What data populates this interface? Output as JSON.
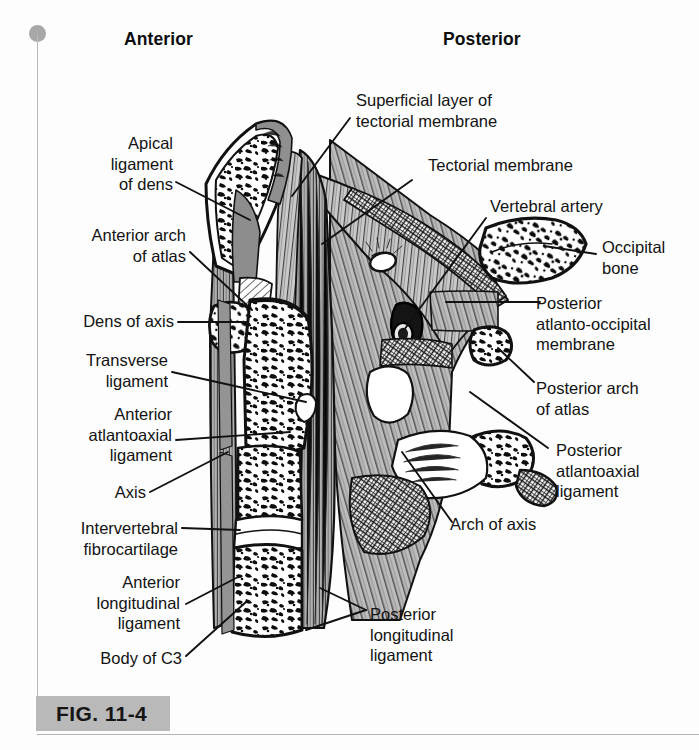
{
  "figure": {
    "number_label": "FIG. 11-4",
    "orientation": {
      "anterior": "Anterior",
      "posterior": "Posterior"
    }
  },
  "labels": {
    "left": [
      {
        "id": "apical-ligament-of-dens",
        "text": "Apical\nligament\nof dens"
      },
      {
        "id": "anterior-arch-of-atlas",
        "text": "Anterior arch\nof atlas"
      },
      {
        "id": "dens-of-axis",
        "text": "Dens of axis"
      },
      {
        "id": "transverse-ligament",
        "text": "Transverse\nligament"
      },
      {
        "id": "anterior-atlantoaxial-ligament",
        "text": "Anterior\natlantoaxial\nligament"
      },
      {
        "id": "axis",
        "text": "Axis"
      },
      {
        "id": "intervertebral-fibrocartilage",
        "text": "Intervertebral\nfibrocartilage"
      },
      {
        "id": "anterior-longitudinal-ligament",
        "text": "Anterior\nlongitudinal\nligament"
      },
      {
        "id": "body-of-c3",
        "text": "Body of C3"
      }
    ],
    "right": [
      {
        "id": "superficial-layer-of-tectorial-membrane",
        "text": "Superficial layer of\ntectorial membrane"
      },
      {
        "id": "tectorial-membrane",
        "text": "Tectorial membrane"
      },
      {
        "id": "vertebral-artery",
        "text": "Vertebral artery"
      },
      {
        "id": "occipital-bone",
        "text": "Occipital\nbone"
      },
      {
        "id": "posterior-atlanto-occipital-membrane",
        "text": "Posterior\natlanto-occipital\nmembrane"
      },
      {
        "id": "posterior-arch-of-atlas",
        "text": "Posterior arch\nof atlas"
      },
      {
        "id": "posterior-atlantoaxial-ligament",
        "text": "Posterior\natlantoaxial\nligament"
      },
      {
        "id": "arch-of-axis",
        "text": "Arch of axis"
      },
      {
        "id": "posterior-longitudinal-ligament",
        "text": "Posterior\nlongitudinal\nligament"
      }
    ]
  },
  "colors": {
    "band": "#b9b9b9",
    "ink": "#111111",
    "paper": "#fdfdfd",
    "bone_fill": "#ffffff",
    "ligament_gray": "#9a9a9a",
    "membrane_gray": "#c4c4c4",
    "artery_dark": "#1c1c1c"
  }
}
